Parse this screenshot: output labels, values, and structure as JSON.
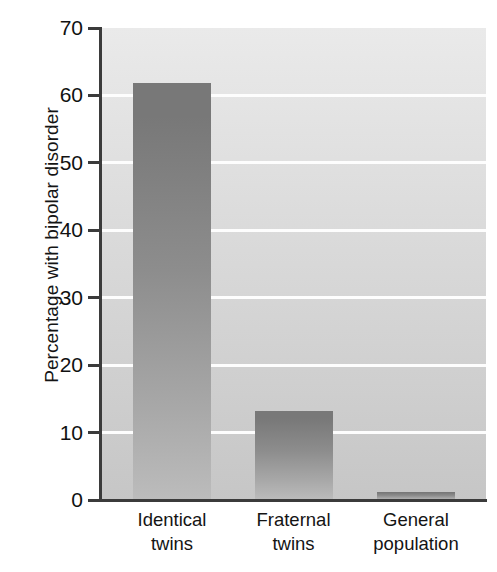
{
  "chart_data": {
    "type": "bar",
    "title": "",
    "xlabel": "",
    "ylabel": "Percentage with bipolar disorder",
    "ylim": [
      0,
      70
    ],
    "yticks": [
      0,
      10,
      20,
      30,
      40,
      50,
      60,
      70
    ],
    "ytick_labels": [
      "0",
      "10",
      "20",
      "30",
      "40",
      "50",
      "60",
      "70"
    ],
    "grid": true,
    "grid_color": "#ffffff",
    "legend": "none",
    "categories": [
      "Identical twins",
      "Fraternal twins",
      "General population"
    ],
    "category_lines": [
      [
        "Identical",
        "twins"
      ],
      [
        "Fraternal",
        "twins"
      ],
      [
        "General",
        "population"
      ]
    ],
    "values": [
      61.8,
      13.2,
      1.2
    ],
    "bars": [
      {
        "label": "Identical twins",
        "value": 61.8
      },
      {
        "label": "Fraternal twins",
        "value": 13.2
      },
      {
        "label": "General population",
        "value": 1.2
      }
    ],
    "colors": {
      "bar_top": "#787878",
      "bar_bottom": "#bcbcbc",
      "plot_background_top": "#eaeaea",
      "plot_background_bottom": "#c6c6c6",
      "axis": "#3b3b3b",
      "text": "#141414",
      "gridline": "#fdfdfd"
    }
  }
}
